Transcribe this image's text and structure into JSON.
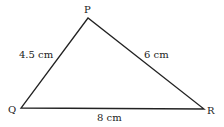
{
  "diagram": {
    "type": "triangle",
    "vertices": {
      "P": {
        "label": "P",
        "x": 88,
        "y": 18
      },
      "Q": {
        "label": "Q",
        "x": 21,
        "y": 108
      },
      "R": {
        "label": "R",
        "x": 204,
        "y": 109
      }
    },
    "sides": {
      "PQ": {
        "label": "4.5 cm"
      },
      "PR": {
        "label": "6 cm"
      },
      "QR": {
        "label": "8 cm"
      }
    },
    "stroke_color": "#222222"
  }
}
